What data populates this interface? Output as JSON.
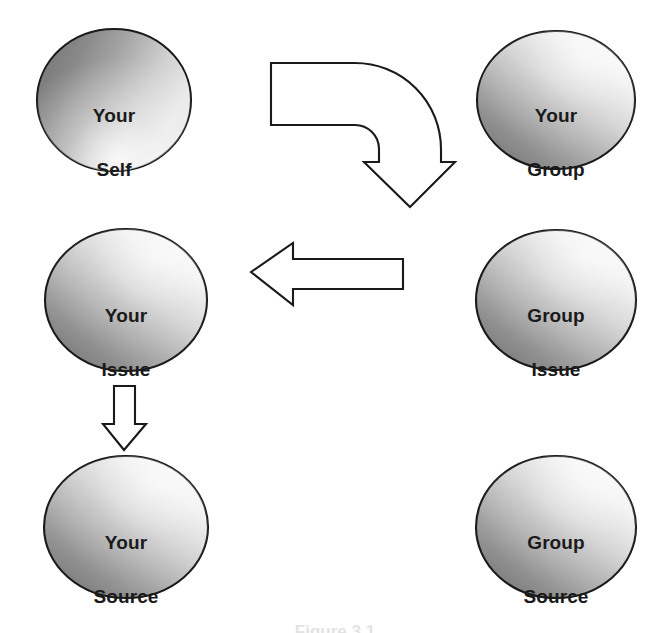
{
  "figure": {
    "background_color": "#ffffff",
    "outline_color": "#1a1a1a",
    "text_color": "#1a1a1a",
    "gradient_light": "#f2f2f2",
    "gradient_dark": "#777777",
    "caption_text": "Figure 3.1"
  },
  "nodes": [
    {
      "id": "your-self",
      "line1": "Your",
      "line2": "Self",
      "label": "Your Self",
      "cx": 114,
      "cy": 100,
      "rx": 77,
      "ry": 71
    },
    {
      "id": "your-group",
      "line1": "Your",
      "line2": "Group",
      "label": "Your Group",
      "cx": 556,
      "cy": 100,
      "rx": 79,
      "ry": 69
    },
    {
      "id": "your-issue",
      "line1": "Your",
      "line2": "Issue",
      "label": "Your Issue",
      "cx": 126,
      "cy": 300,
      "rx": 81,
      "ry": 71
    },
    {
      "id": "group-issue",
      "line1": "Group",
      "line2": "Issue",
      "label": "Group Issue",
      "cx": 556,
      "cy": 300,
      "rx": 80,
      "ry": 70
    },
    {
      "id": "your-source",
      "line1": "Your",
      "line2": "Source",
      "label": "Your Source",
      "cx": 126,
      "cy": 527,
      "rx": 82,
      "ry": 71
    },
    {
      "id": "group-source",
      "line1": "Group",
      "line2": "Source",
      "label": "Group Source",
      "cx": 556,
      "cy": 527,
      "rx": 80,
      "ry": 71
    }
  ],
  "arrows": [
    {
      "id": "self-to-group",
      "name": "bent-arrow-right-down",
      "from": "your-self",
      "to": "your-group",
      "direction": "right-then-down"
    },
    {
      "id": "group-issue-to-your-issue",
      "name": "arrow-left",
      "from": "group-issue",
      "to": "your-issue",
      "direction": "left"
    },
    {
      "id": "your-issue-to-your-source",
      "name": "arrow-down",
      "from": "your-issue",
      "to": "your-source",
      "direction": "down"
    }
  ]
}
